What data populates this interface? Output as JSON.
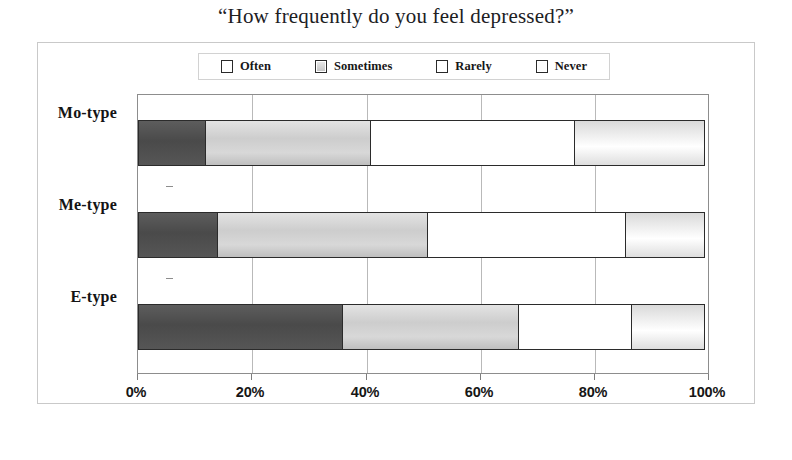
{
  "title": "“How frequently do you feel depressed?”",
  "legend": {
    "position": "top-center",
    "items": [
      {
        "label": "Often",
        "swatch": "dark-gray-swatch-icon",
        "color": "#4a4a4a"
      },
      {
        "label": "Sometimes",
        "swatch": "light-gray-swatch-icon",
        "color": "#cdcdcd"
      },
      {
        "label": "Rarely",
        "swatch": "white-swatch-icon",
        "color": "#ffffff"
      },
      {
        "label": "Never",
        "swatch": "pale-gray-swatch-icon",
        "color": "#eeeeee"
      }
    ]
  },
  "axis": {
    "x_ticks": [
      "0%",
      "20%",
      "40%",
      "60%",
      "80%",
      "100%"
    ],
    "y_ticks": [
      "Mo-type",
      "Me-type",
      "E-type"
    ]
  },
  "chart_data": {
    "type": "bar",
    "orientation": "horizontal",
    "stacked": true,
    "stack_normalized": "percent",
    "title": "“How frequently do you feel depressed?”",
    "xlabel": "",
    "ylabel": "",
    "xlim": [
      0,
      100
    ],
    "xtick_values": [
      0,
      20,
      40,
      60,
      80,
      100
    ],
    "xtick_labels": [
      "0%",
      "20%",
      "40%",
      "60%",
      "80%",
      "100%"
    ],
    "grid": "vertical",
    "legend_position": "top-center",
    "categories": [
      "Mo-type",
      "Me-type",
      "E-type"
    ],
    "series": [
      {
        "name": "Often",
        "color": "#4a4a4a",
        "values": [
          12,
          14,
          36
        ]
      },
      {
        "name": "Sometimes",
        "color": "#cdcdcd",
        "values": [
          29,
          37,
          31
        ]
      },
      {
        "name": "Rarely",
        "color": "#ffffff",
        "values": [
          36,
          35,
          20
        ]
      },
      {
        "name": "Never",
        "color": "#eeeeee",
        "values": [
          23,
          14,
          13
        ]
      }
    ],
    "cumulative_boundaries": {
      "Mo-type": [
        12,
        41,
        77,
        100
      ],
      "Me-type": [
        14,
        51,
        86,
        100
      ],
      "E-type": [
        36,
        67,
        87,
        100
      ]
    }
  }
}
